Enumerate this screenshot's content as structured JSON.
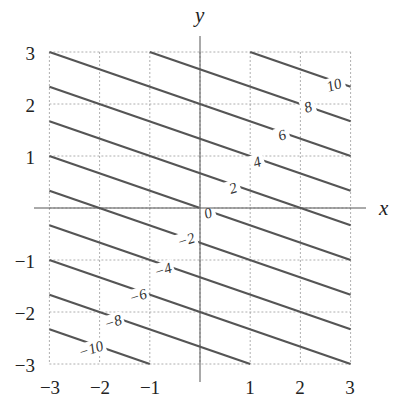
{
  "chart_data": {
    "type": "contour",
    "function": "z = x + 3y",
    "title": "",
    "xlabel": "x",
    "ylabel": "y",
    "xlim": [
      -3,
      3
    ],
    "ylim": [
      -3,
      3
    ],
    "grid": true,
    "x_ticks": [
      -3,
      -2,
      -1,
      1,
      2,
      3
    ],
    "y_ticks": [
      3,
      2,
      1,
      -1,
      -2,
      -3
    ],
    "levels": [
      -10,
      -8,
      -6,
      -4,
      -2,
      0,
      2,
      4,
      6,
      8,
      10
    ],
    "level_labels": [
      "−10",
      "−8",
      "−6",
      "−4",
      "−2",
      "0",
      "2",
      "4",
      "6",
      "8",
      "10"
    ],
    "line_color": "#555555",
    "grid_color": "#9a9a9a"
  },
  "axes": {
    "x_label": "x",
    "y_label": "y",
    "x_tick_labels": [
      "−3",
      "−2",
      "−1",
      "1",
      "2",
      "3"
    ],
    "y_tick_labels": [
      "3",
      "2",
      "1",
      "−1",
      "−2",
      "−3"
    ]
  },
  "contour_labels": [
    {
      "text": "10",
      "x": 334,
      "y": 85,
      "angle": -18
    },
    {
      "text": "8",
      "x": 308,
      "y": 107,
      "angle": -18
    },
    {
      "text": "6",
      "x": 282,
      "y": 135,
      "angle": -18
    },
    {
      "text": "4",
      "x": 257,
      "y": 162,
      "angle": -18
    },
    {
      "text": "2",
      "x": 233,
      "y": 188,
      "angle": -18
    },
    {
      "text": "0",
      "x": 208,
      "y": 213,
      "angle": -18
    },
    {
      "text": "−2",
      "x": 186,
      "y": 240,
      "angle": -18
    },
    {
      "text": "−4",
      "x": 163,
      "y": 270,
      "angle": -18
    },
    {
      "text": "−6",
      "x": 138,
      "y": 296,
      "angle": -18
    },
    {
      "text": "−8",
      "x": 113,
      "y": 322,
      "angle": -18
    },
    {
      "text": "−10",
      "x": 91,
      "y": 349,
      "angle": -18
    }
  ]
}
